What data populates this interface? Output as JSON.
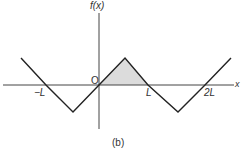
{
  "figure": {
    "caption": "(b)",
    "y_axis_label": "f(x)",
    "x_axis_label": "x",
    "origin_label": "O",
    "tick_labels": {
      "neg_L": "−L",
      "L": "L",
      "two_L": "2L"
    },
    "wave_points": [
      [
        21,
        58
      ],
      [
        46,
        85
      ],
      [
        73,
        112
      ],
      [
        99,
        85
      ],
      [
        125,
        58
      ],
      [
        148,
        85
      ],
      [
        178,
        112
      ],
      [
        205,
        85
      ],
      [
        231,
        58
      ]
    ],
    "shaded_region": [
      [
        99,
        85
      ],
      [
        125,
        58
      ],
      [
        148,
        85
      ]
    ],
    "colors": {
      "line": "#222222",
      "axis": "#444444",
      "shade": "#dcdcdc"
    }
  }
}
